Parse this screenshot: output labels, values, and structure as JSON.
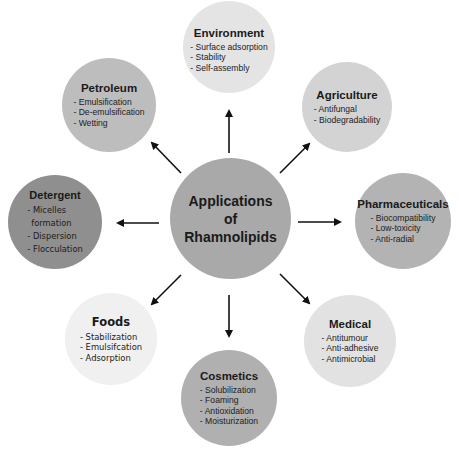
{
  "diagram": {
    "center": {
      "line1": "Applications",
      "line2": "of",
      "line3": "Rhamnolipids",
      "color": "#a9a9a9"
    },
    "nodes": [
      {
        "id": "environment",
        "title": "Environment",
        "items": [
          "- Surface adsorption",
          "- Stability",
          "- Self-assembly"
        ],
        "color": "#e4e4e4"
      },
      {
        "id": "petroleum",
        "title": "Petroleum",
        "items": [
          "- Emulsification",
          "- De-emulsification",
          "- Wetting"
        ],
        "color": "#bdbdbd"
      },
      {
        "id": "agriculture",
        "title": "Agriculture",
        "items": [
          "- Antifungal",
          "- Biodegradability"
        ],
        "color": "#d3d3d3"
      },
      {
        "id": "detergent",
        "title": "Detergent",
        "items": [
          "- Micelles",
          "formation",
          "- Dispersion",
          "- Flocculation"
        ],
        "color": "#8f8f8f"
      },
      {
        "id": "pharmaceuticals",
        "title": "Pharmaceuticals",
        "items": [
          "- Biocompatibility",
          "- Low-toxicity",
          "- Anti-radial"
        ],
        "color": "#b3b3b3"
      },
      {
        "id": "foods",
        "title": "Foods",
        "items": [
          "- Stabilization",
          "- Emulsifcation",
          "- Adsorption"
        ],
        "color": "#f0f0f0"
      },
      {
        "id": "medical",
        "title": "Medical",
        "items": [
          "- Antitumour",
          "- Anti-adhesive",
          "- Antimicrobial"
        ],
        "color": "#e2e2e2"
      },
      {
        "id": "cosmetics",
        "title": "Cosmetics",
        "items": [
          "- Solubilization",
          "- Foaming",
          "- Antioxidation",
          "- Moisturization"
        ],
        "color": "#b0b0b0"
      }
    ],
    "arrow_color": "#111111"
  }
}
